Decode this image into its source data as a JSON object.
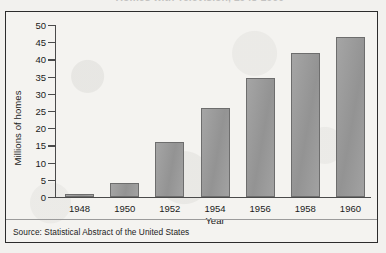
{
  "figure": {
    "title_partial": "Homes with Television, 1948-1960",
    "source": "Source: Statistical Abstract of the United States",
    "frame_color": "#2c2c2c",
    "bar_fill": "#9b9b9b",
    "bar_stroke": "#6d6d6d",
    "background": "#f4f3f0"
  },
  "chart_data": {
    "type": "bar",
    "title": "Homes with Television, 1948-1960",
    "xlabel": "Year",
    "ylabel": "Millions of homes",
    "categories": [
      "1948",
      "1950",
      "1952",
      "1954",
      "1956",
      "1958",
      "1960"
    ],
    "values": [
      1,
      4,
      16,
      26,
      34.5,
      42,
      46.5
    ],
    "ylim": [
      0,
      50
    ],
    "ytick_labels": [
      "0",
      "5",
      "10",
      "15",
      "20",
      "25",
      "30",
      "35",
      "40",
      "45",
      "50"
    ],
    "ytick_values": [
      0,
      5,
      10,
      15,
      20,
      25,
      30,
      35,
      40,
      45,
      50
    ],
    "grid": false,
    "legend": null,
    "source": "Source: Statistical Abstract of the United States"
  }
}
